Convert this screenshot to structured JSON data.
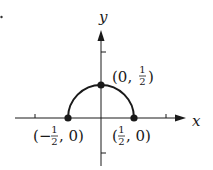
{
  "figure": {
    "type": "graph",
    "axes": {
      "x_label": "x",
      "y_label": "y",
      "x_ticks": [
        -1,
        1
      ],
      "y_ticks": [
        1,
        -1
      ]
    },
    "curve": {
      "shape": "upper-semicircle",
      "center": [
        0,
        0
      ],
      "radius": 0.5,
      "color": "#1a1a1a"
    },
    "points": [
      {
        "id": "left",
        "coords": [
          -0.5,
          0
        ],
        "label_open": "(",
        "label_neg": "−",
        "label_num": "1",
        "label_den": "2",
        "label_tail": ", 0)"
      },
      {
        "id": "top",
        "coords": [
          0,
          0.5
        ],
        "label_head": "(0, ",
        "label_num": "1",
        "label_den": "2",
        "label_close": ")"
      },
      {
        "id": "right",
        "coords": [
          0.5,
          0
        ],
        "label_open": "(",
        "label_num": "1",
        "label_den": "2",
        "label_tail": ", 0)"
      }
    ],
    "colors": {
      "ink": "#1a1a1a",
      "background": "#ffffff"
    }
  }
}
